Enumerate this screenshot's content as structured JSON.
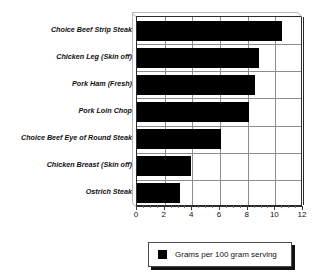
{
  "chart_data": {
    "type": "bar",
    "orientation": "horizontal",
    "title": "",
    "xlabel": "",
    "ylabel": "",
    "xlim": [
      0,
      12
    ],
    "xticks": [
      0,
      2,
      4,
      6,
      8,
      10,
      12
    ],
    "grid": true,
    "legend_position": "bottom",
    "categories": [
      "Choice Beef Strip Steak",
      "Chicken Leg (Skin off)",
      "Pork Ham (Fresh)",
      "Pork Loin Chop",
      "Choice Beef Eye of Round Steak",
      "Chicken Breast (Skin off)",
      "Ostrich Steak"
    ],
    "values": [
      10.5,
      8.8,
      8.5,
      8.1,
      6.1,
      3.9,
      3.1
    ],
    "series": [
      {
        "name": "Grams per 100 gram serving",
        "color": "#000000",
        "values": [
          10.5,
          8.8,
          8.5,
          8.1,
          6.1,
          3.9,
          3.1
        ]
      }
    ]
  },
  "legend": {
    "label": "Grams per 100 gram serving",
    "swatch_color": "#000000"
  },
  "axis": {
    "tick_labels": [
      "0",
      "2",
      "4",
      "6",
      "8",
      "10",
      "12"
    ]
  },
  "colors": {
    "bar": "#000000",
    "grid": "#8d8d8d",
    "frame": "#2b2b2b",
    "background": "#ffffff",
    "text": "#111111"
  }
}
